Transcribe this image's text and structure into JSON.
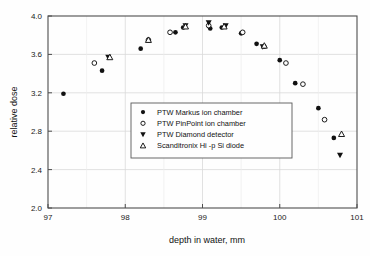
{
  "chart_data": {
    "type": "scatter",
    "title": "",
    "xlabel": "depth in water, mm",
    "ylabel": "relative dose",
    "xlim": [
      97,
      101
    ],
    "ylim": [
      2.0,
      4.0
    ],
    "xticks": [
      "97",
      "98",
      "99",
      "100",
      "101"
    ],
    "xtick_values": [
      97,
      98,
      99,
      100,
      101
    ],
    "yticks": [
      "2.0",
      "2.4",
      "2.8",
      "3.2",
      "3.6",
      "4.0"
    ],
    "ytick_values": [
      2.0,
      2.4,
      2.8,
      3.2,
      3.6,
      4.0
    ],
    "grid": true,
    "grid_minor_x": [
      97.5,
      98.5,
      99.5,
      100.5
    ],
    "legend_position": "center-left",
    "series": [
      {
        "name": "PTW Markus ion chamber",
        "marker": "filled-circle",
        "color": "#111111",
        "points": [
          [
            97.2,
            3.19
          ],
          [
            97.7,
            3.43
          ],
          [
            98.2,
            3.66
          ],
          [
            98.65,
            3.83
          ],
          [
            98.75,
            3.88
          ],
          [
            99.1,
            3.87
          ],
          [
            99.25,
            3.88
          ],
          [
            99.5,
            3.82
          ],
          [
            99.7,
            3.71
          ],
          [
            99.8,
            3.68
          ],
          [
            100.0,
            3.54
          ],
          [
            100.2,
            3.3
          ],
          [
            100.5,
            3.04
          ],
          [
            100.7,
            2.73
          ]
        ]
      },
      {
        "name": "PTW PinPoint ion chamber",
        "marker": "open-circle",
        "color": "#111111",
        "points": [
          [
            97.6,
            3.51
          ],
          [
            98.3,
            3.75
          ],
          [
            98.58,
            3.83
          ],
          [
            99.08,
            3.9
          ],
          [
            99.52,
            3.83
          ],
          [
            100.08,
            3.51
          ],
          [
            100.3,
            3.29
          ],
          [
            100.58,
            2.92
          ]
        ]
      },
      {
        "name": "PTW Diamond detector",
        "marker": "filled-down-triangle",
        "color": "#111111",
        "points": [
          [
            97.78,
            3.57
          ],
          [
            98.78,
            3.9
          ],
          [
            99.08,
            3.93
          ],
          [
            99.3,
            3.9
          ],
          [
            99.78,
            3.68
          ],
          [
            100.78,
            2.55
          ]
        ]
      },
      {
        "name": "Scanditronix Hi -p Si diode",
        "marker": "open-up-triangle",
        "color": "#111111",
        "points": [
          [
            97.8,
            3.57
          ],
          [
            98.3,
            3.75
          ],
          [
            98.78,
            3.89
          ],
          [
            99.28,
            3.89
          ],
          [
            99.8,
            3.69
          ],
          [
            100.8,
            2.77
          ]
        ]
      }
    ]
  },
  "legend": {
    "items": [
      {
        "label": "PTW Markus ion chamber",
        "marker": "filled-circle"
      },
      {
        "label": "PTW PinPoint ion chamber",
        "marker": "open-circle"
      },
      {
        "label": "PTW Diamond detector",
        "marker": "filled-down-triangle"
      },
      {
        "label": "Scanditronix Hi -p Si diode",
        "marker": "open-up-triangle"
      }
    ]
  },
  "style": {
    "axis_color": "#4d4d4d",
    "grid_color": "#d9d9d9",
    "marker_color": "#111111",
    "background": "#fefefe"
  }
}
